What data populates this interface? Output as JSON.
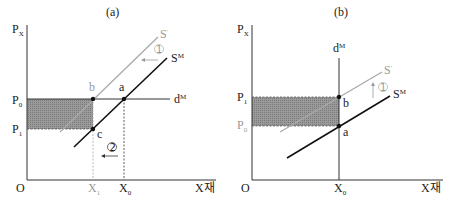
{
  "panels": [
    {
      "id": "a",
      "title": "(a)",
      "y_axis_label": "P",
      "y_axis_sub": "X",
      "origin_label": "O",
      "x_axis_label": "X재",
      "price_labels": [
        {
          "main": "P",
          "sub": "0",
          "color": "#222222"
        },
        {
          "main": "P",
          "sub": "1",
          "color": "#222222"
        }
      ],
      "quantity_labels": [
        {
          "main": "X",
          "sub": "1",
          "color": "#aaaaaa"
        },
        {
          "main": "X",
          "sub": "0",
          "color": "#222222"
        }
      ],
      "curves": [
        {
          "main": "S",
          "sup": "'",
          "color": "#999999"
        },
        {
          "main": "S",
          "sup": "M",
          "color": "#111111"
        },
        {
          "main": "d",
          "sup": "M",
          "color": "#222222"
        }
      ],
      "points": [
        {
          "label": "b",
          "color": "#999999"
        },
        {
          "label": "a",
          "color": "#222222"
        },
        {
          "label": "c",
          "color": "#222222"
        }
      ],
      "annotations": [
        {
          "label": "①",
          "arrow": "left",
          "color": "#999999"
        },
        {
          "label": "②",
          "arrow": "left",
          "color": "#222222"
        }
      ],
      "shaded_color": "#8c8c8c"
    },
    {
      "id": "b",
      "title": "(b)",
      "y_axis_label": "P",
      "y_axis_sub": "X",
      "origin_label": "O",
      "x_axis_label": "X재",
      "price_labels": [
        {
          "main": "P",
          "sub": "1",
          "color": "#222222"
        },
        {
          "main": "P",
          "sub": "0",
          "color": "#aaaaaa"
        }
      ],
      "quantity_labels": [
        {
          "main": "X",
          "sub": "0",
          "color": "#222222"
        }
      ],
      "curves": [
        {
          "main": "d",
          "sup": "M",
          "color": "#222222"
        },
        {
          "main": "S",
          "sup": "'",
          "color": "#999999"
        },
        {
          "main": "S",
          "sup": "M",
          "color": "#111111"
        }
      ],
      "points": [
        {
          "label": "b",
          "color": "#222222"
        },
        {
          "label": "a",
          "color": "#222222"
        }
      ],
      "annotations": [
        {
          "label": "①",
          "arrow": "up",
          "color": "#999999"
        }
      ],
      "shaded_color": "#8c8c8c"
    }
  ]
}
